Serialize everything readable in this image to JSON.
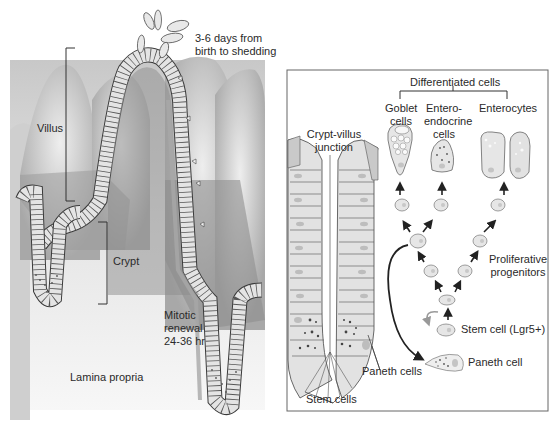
{
  "left_panel": {
    "labels": {
      "shedding_line1": "3-6 days from",
      "shedding_line2": "birth to shedding",
      "villus": "Villus",
      "crypt": "Crypt",
      "mitotic_line1": "Mitotic",
      "mitotic_line2": "renewal",
      "mitotic_line3": "24-36 hr",
      "lamina_propria": "Lamina propria"
    }
  },
  "right_panel": {
    "title": "Differentiated cells",
    "labels": {
      "crypt_villus_line1": "Crypt-villus",
      "crypt_villus_line2": "junction",
      "goblet_line1": "Goblet",
      "goblet_line2": "cells",
      "entero_line1": "Entero-",
      "entero_line2": "endocrine",
      "entero_line3": "cells",
      "enterocytes": "Enterocytes",
      "proliferative_line1": "Proliferative",
      "proliferative_line2": "progenitors",
      "stem_cell_lgr5": "Stem cell (Lgr5+)",
      "paneth_cell": "Paneth cell",
      "paneth_cells": "Paneth cells",
      "stem_cells": "Stem cells"
    }
  },
  "colors": {
    "tissue_dark": "#8f8f8f",
    "tissue_mid": "#b4b4b4",
    "tissue_light": "#d9d9d9",
    "cell_fill": "#e6e6e6",
    "outline": "#3a3a3a",
    "box_border": "#666666"
  }
}
